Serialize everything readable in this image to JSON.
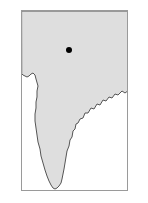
{
  "figure": {
    "type": "locator-map",
    "region_name": "Indian subcontinent",
    "background_color": "#ffffff",
    "frame": {
      "border_color": "#9a9a9a",
      "border_width_px": 1,
      "x": 21,
      "y": 10,
      "width": 107,
      "height": 181
    },
    "landmass": {
      "name": "india-landmass",
      "fill_color": "#dedede",
      "outline_color": "#555555",
      "outline_width_px": 1,
      "description": "Shaded peninsular landmass filling the top, left and right edges of the frame, tapering to a point at the bottom center.",
      "outline_path": "M 0 0 L 107 0 L 107 79 L 103 82 L 100 80 L 96 84 L 93 83 L 90 87 L 87 86 L 84 90 L 81 89 L 78 94 L 75 93 L 72 98 L 69 97 L 66 102 L 63 102 L 61 107 L 58 108 L 56 112 L 54 113 L 53 118 L 51 120 L 50 126 L 48 129 L 47 135 L 45 140 L 44 146 L 43 152 L 42 158 L 41 163 L 40 168 L 39 172 L 37 175 L 35 177 L 33 178 L 31 177 L 29 174 L 27 170 L 25 165 L 23 159 L 21 152 L 19 145 L 18 138 L 16 131 L 15 124 L 14 117 L 13 110 L 13 103 L 14 97 L 14 91 L 15 86 L 15 80 L 16 75 L 14 68 L 13 64 L 11 62 L 9 63 L 7 65 L 5 66 L 3 65 L 1 64 L 0 63 Z"
    },
    "marker": {
      "name": "location-dot",
      "color": "#000000",
      "center_x": 69,
      "center_y": 50,
      "diameter_px": 6,
      "label": ""
    }
  }
}
